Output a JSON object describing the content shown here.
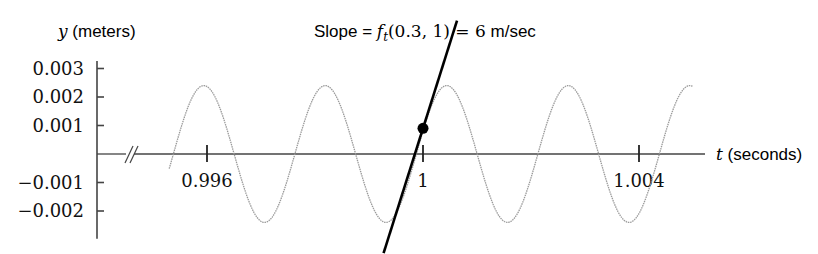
{
  "chart_data": {
    "type": "line",
    "title_parts": {
      "prefix": "Slope = ",
      "func": "f",
      "sub": "t",
      "args": "(0.3, 1) = 6",
      "unit": " m/sec"
    },
    "xlabel": {
      "var": "t",
      "unit": " (seconds)"
    },
    "ylabel": {
      "var": "y",
      "unit": " (meters)"
    },
    "xlim": [
      0.9946,
      1.0052
    ],
    "ylim": [
      -0.0029,
      0.0034
    ],
    "x_ticks": [
      {
        "value": 0.996,
        "label": "0.996"
      },
      {
        "value": 1,
        "label": "1"
      },
      {
        "value": 1.004,
        "label": "1.004"
      }
    ],
    "y_ticks": [
      {
        "value": 0.003,
        "label": "0.003"
      },
      {
        "value": 0.002,
        "label": "0.002"
      },
      {
        "value": 0.001,
        "label": "0.001"
      },
      {
        "value": -0.001,
        "label": "−0.001"
      },
      {
        "value": -0.002,
        "label": "−0.002"
      }
    ],
    "axis_break": "x-axis break near origin",
    "series": [
      {
        "name": "y = f(0.3, t)",
        "style": "dotted-gray",
        "amplitude": 0.0024,
        "period": 0.00225,
        "peak_t": 0.99594,
        "t_range": [
          0.9953,
          1.005
        ]
      },
      {
        "name": "tangent line",
        "style": "solid-black",
        "point": {
          "t": 1,
          "y": 0.0009
        },
        "slope": 6,
        "t_range": [
          0.99927,
          1.00063
        ]
      }
    ],
    "marked_point": {
      "t": 1,
      "y": 0.0009
    },
    "grid": false,
    "colors": {
      "wave": "#9a9a9a",
      "tangent": "#000000",
      "axis": "#444444"
    }
  }
}
